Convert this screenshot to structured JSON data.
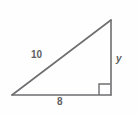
{
  "figure": {
    "name": "right-triangle-diagram",
    "background_color": "#fefefe",
    "stroke_color": "#6e6e70",
    "label_color": "#5f5f61",
    "shape": {
      "type": "right-triangle",
      "vertices": {
        "left": [
          12,
          95
        ],
        "bottom_right": [
          111,
          95
        ],
        "top_right": [
          111,
          20
        ]
      },
      "right_angle_vertex": "bottom_right",
      "right_angle_marker_size": 11
    },
    "labels": {
      "hypotenuse": "10",
      "base": "8",
      "vertical_leg": "y"
    }
  }
}
